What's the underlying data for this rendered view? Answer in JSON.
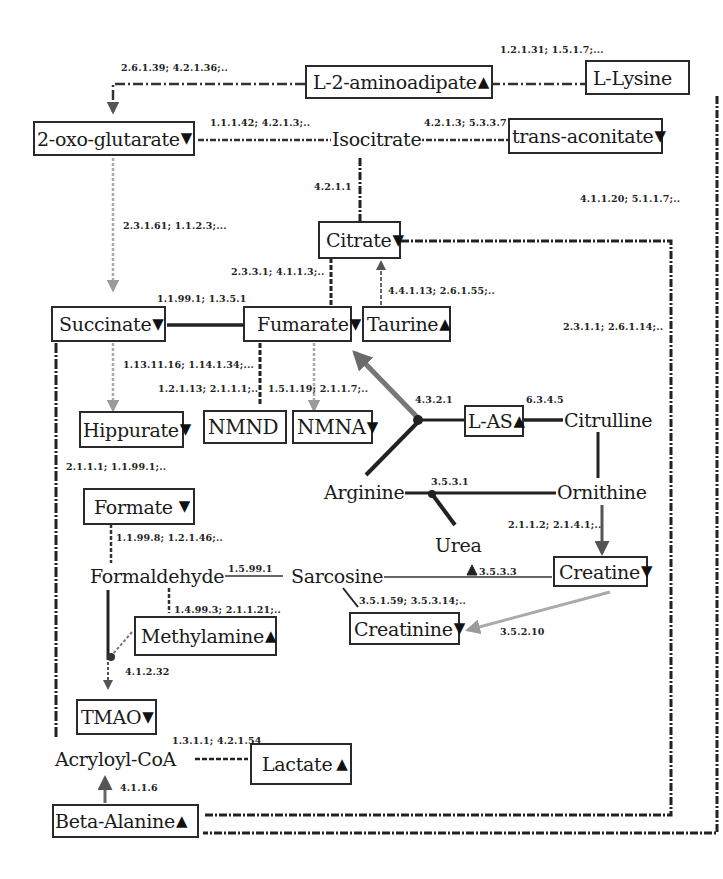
{
  "diagram": {
    "type": "metabolic-pathway",
    "legend_markers": {
      "down": "▼",
      "up": "▲"
    },
    "colors": {
      "line": "#1a1a1a",
      "gray_arrow": "#7a7a7a",
      "light_gray_arrow": "#a8a8a8",
      "box_border": "#2a2a2a"
    }
  },
  "nodes": {
    "l2_aminoadipate": {
      "label": "L-2-aminoadipate",
      "marker": "▲"
    },
    "l_lysine": {
      "label": "L-Lysine",
      "marker": ""
    },
    "oxoglutarate": {
      "label": "2-oxo-glutarate",
      "marker": "▼"
    },
    "isocitrate": {
      "label": "Isocitrate"
    },
    "trans_aconitate": {
      "label": "trans-aconitate",
      "marker": "▼"
    },
    "citrate": {
      "label": "Citrate",
      "marker": "▼"
    },
    "succinate": {
      "label": "Succinate",
      "marker": "▼"
    },
    "fumarate": {
      "label": "Fumarate",
      "marker": "▼"
    },
    "taurine": {
      "label": "Taurine",
      "marker": "▲"
    },
    "hippurate": {
      "label": "Hippurate",
      "marker": "▼"
    },
    "nmnd": {
      "label": "NMND",
      "marker": ""
    },
    "nmna": {
      "label": "NMNA",
      "marker": "▼"
    },
    "l_as": {
      "label": "L-AS",
      "marker": "▲"
    },
    "citrulline": {
      "label": "Citrulline"
    },
    "arginine": {
      "label": "Arginine"
    },
    "ornithine": {
      "label": "Ornithine"
    },
    "formate": {
      "label": "Formate",
      "marker": "▼"
    },
    "urea": {
      "label": "Urea"
    },
    "formaldehyde": {
      "label": "Formaldehyde"
    },
    "sarcosine": {
      "label": "Sarcosine"
    },
    "creatine": {
      "label": "Creatine",
      "marker": "▼"
    },
    "methylamine": {
      "label": "Methylamine",
      "marker": "▲"
    },
    "creatinine": {
      "label": "Creatinine",
      "marker": "▼"
    },
    "tmao": {
      "label": "TMAO",
      "marker": "▼"
    },
    "acryloyl_coa": {
      "label": "Acryloyl-CoA"
    },
    "lactate": {
      "label": "Lactate",
      "marker": "▲"
    },
    "beta_alanine": {
      "label": "Beta-Alanine",
      "marker": "▲"
    }
  },
  "edges": {
    "aminoadipate_to_oxoglutarate": "2.6.1.39; 4.2.1.36;..",
    "lysine_aminoadipate": "1.2.1.31; 1.5.1.7;...",
    "oxoglutarate_isocitrate": "1.1.1.42; 4.2.1.3;..",
    "isocitrate_transaconitate": "4.2.1.3; 5.3.3.7",
    "isocitrate_citrate": "4.2.1.1",
    "lysine_right": "4.1.1.20; 5.1.1.7;..",
    "oxoglutarate_succinate": "2.3.1.61; 1.1.2.3;...",
    "citrate_fumarate": "2.3.3.1; 4.1.1.3;..",
    "taurine_citrate": "4.4.1.13; 2.6.1.55;..",
    "succinate_fumarate": "1.1.99.1; 1.3.5.1",
    "citrate_right": "2.3.1.1; 2.6.1.14;..",
    "succinate_hippurate": "1.13.11.16; 1.14.1.34;...",
    "fumarate_nmnd": "1.2.1.13; 2.1.1.1;..",
    "fumarate_nmna": "1.5.1.19; 2.1.1.7;..",
    "arginine_fumarate": "4.3.2.1",
    "citrulline_las": "6.3.4.5",
    "hippurate_left": "2.1.1.1; 1.1.99.1;..",
    "ornithine_arginine": "3.5.3.1",
    "ornithine_creatine": "2.1.1.2; 2.1.4.1;..",
    "formate_formaldehyde": "1.1.99.8; 1.2.1.46;..",
    "formaldehyde_sarcosine": "1.5.99.1",
    "urea_sarcosine": "3.5.3.3",
    "sarcosine_creatinine": "3.5.1.59; 3.5.3.14;..",
    "formaldehyde_methylamine": "1.4.99.3; 2.1.1.21;..",
    "creatine_creatinine": "3.5.2.10",
    "methylamine_tmao": "4.1.2.32",
    "acryloyl_lactate": "1.3.1.1; 4.2.1.54",
    "betaalanine_acryloyl": "4.1.1.6"
  }
}
